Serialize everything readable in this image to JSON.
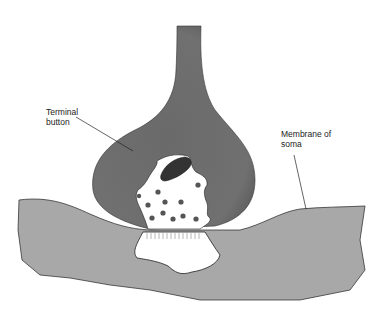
{
  "diagram": {
    "labels": {
      "terminal_button": [
        "Terminal",
        "button"
      ],
      "membrane_of_soma": [
        "Membrane of",
        "soma"
      ]
    },
    "colors": {
      "terminal_fill": "#6e6e6e",
      "soma_fill": "#a8a8a8",
      "vesicle": "#555555",
      "mitochondrion": "#3a3a3a",
      "background": "#ffffff"
    },
    "vesicle_count": 11
  }
}
